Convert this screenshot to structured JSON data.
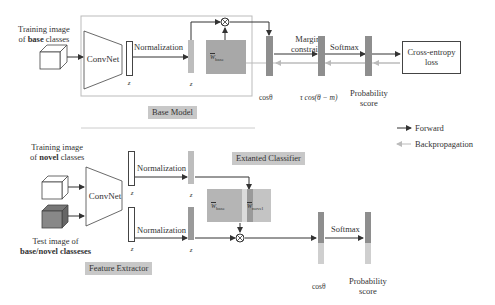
{
  "top": {
    "input_label_line1": "Training image",
    "input_label_line2_prefix": "of ",
    "input_label_line2_bold": "base",
    "input_label_line2_suffix": " classes",
    "convnet": "ConvNet",
    "z_label": "z",
    "normalization": "Normalization",
    "z_norm_label": "z",
    "weight": "W",
    "weight_sub": "base",
    "margin_line1": "Margin",
    "margin_line2": "constraint",
    "softmax": "Softmax",
    "loss_line1": "Cross-entropy",
    "loss_line2": "loss",
    "cos": "cosθ",
    "rcos": "τ cos(θ − m)",
    "prob_line1": "Probability",
    "prob_line2": "score",
    "section_tag": "Base Model"
  },
  "legend": {
    "forward": "Forward",
    "backprop": "Backpropagation"
  },
  "bottom": {
    "train_label_line1": "Training image",
    "train_label_line2_prefix": "of ",
    "train_label_line2_bold": "novel",
    "train_label_line2_suffix": " classes",
    "test_label_line1": "Test image of",
    "test_label_line2": "base/novel classeses",
    "convnet": "ConvNet",
    "z_label": "z",
    "normalization": "Normalization",
    "z_norm_label": "z",
    "classifier_tag": "Extanted Classifier",
    "weight_base": "W",
    "weight_base_sub": "base",
    "weight_novel": "W",
    "weight_novel_sub": "novel",
    "softmax": "Softmax",
    "cos": "cosθ",
    "prob_line1": "Probability",
    "prob_line2": "score",
    "section_tag": "Feature Extractor"
  },
  "colors": {
    "bar": "#8e8e8e",
    "bar_light": "#bdbdbd",
    "weight_box": "#a8a8a8",
    "tag_bg": "#c8c8c8",
    "backprop_line": "#bbbbbb"
  }
}
